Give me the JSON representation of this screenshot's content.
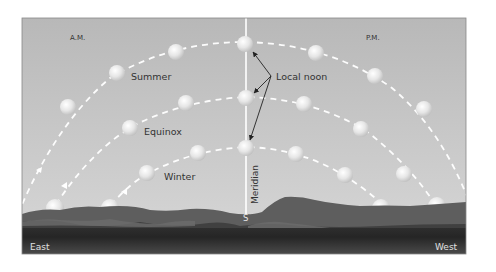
{
  "diagram": {
    "labels": {
      "am": "A.M.",
      "pm": "P.M.",
      "summer": "Summer",
      "equinox": "Equinox",
      "winter": "Winter",
      "local_noon": "Local noon",
      "meridian": "Meridian",
      "south": "S",
      "east": "East",
      "west": "West"
    },
    "colors": {
      "sky_top": "#b9b9b9",
      "sky_bottom": "#d6d6d6",
      "path_dash": "#ffffff",
      "meridian_line": "#ffffff",
      "hills_far": "#6a6a6a",
      "hills_near": "#4a4a4a",
      "ground": "#3a3a3a",
      "text_dark": "#333333",
      "text_light": "#e8e8e8",
      "arrow": "#222222"
    },
    "paths": [
      {
        "name": "Summer",
        "suns": [
          [
            68,
            107
          ],
          [
            117,
            73
          ],
          [
            176,
            52
          ],
          [
            245,
            44
          ],
          [
            316,
            53
          ],
          [
            375,
            76
          ],
          [
            424,
            109
          ]
        ],
        "d": "M 22 212 Q 60 120 110 78 Q 170 42 245 42 Q 330 44 390 88 Q 440 130 468 200"
      },
      {
        "name": "Equinox",
        "suns": [
          [
            130,
            128
          ],
          [
            186,
            103
          ],
          [
            246,
            98
          ],
          [
            304,
            104
          ],
          [
            361,
            129
          ],
          [
            402,
            174
          ]
        ],
        "d": "M 55 210 Q 90 150 135 125 Q 185 100 246 97 Q 310 98 365 130 Q 410 165 438 208"
      },
      {
        "name": "Winter",
        "suns": [
          [
            147,
            173
          ],
          [
            198,
            153
          ],
          [
            245,
            148
          ],
          [
            296,
            154
          ],
          [
            345,
            175
          ],
          [
            380,
            205
          ]
        ],
        "d": "M 110 210 Q 130 180 155 170 Q 195 150 245 147 Q 300 148 345 176 Q 375 195 390 210"
      }
    ],
    "rising_suns": [
      [
        53,
        207
      ],
      [
        110,
        207
      ]
    ],
    "setting_suns": [
      [
        380,
        207
      ],
      [
        437,
        207
      ]
    ]
  }
}
